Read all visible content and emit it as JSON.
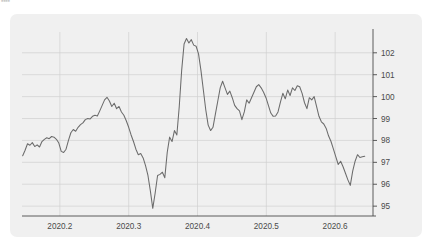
{
  "corner_artifact": "▪▪▪▪",
  "card": {
    "background_color": "#f0f0f0",
    "page_background_color": "#ffffff"
  },
  "chart_data": {
    "type": "line",
    "title": "",
    "subtitle": "",
    "xlabel": "",
    "ylabel": "",
    "grid": true,
    "legend": false,
    "legend_position": "none",
    "y_axis_side": "right",
    "line_color": "#6b6b6b",
    "grid_color": "#d0d0d0",
    "axis_color": "#4a4a4a",
    "xlim": [
      2020.145,
      2020.655
    ],
    "ylim": [
      94.55,
      102.95
    ],
    "xticks": [
      2020.2,
      2020.3,
      2020.4,
      2020.5,
      2020.6
    ],
    "xticklabels": [
      "2020.2",
      "2020.3",
      "2020.4",
      "2020.5",
      "2020.6"
    ],
    "yticks": [
      95,
      96,
      97,
      98,
      99,
      100,
      101,
      102
    ],
    "yticklabels": [
      "95",
      "96",
      "97",
      "98",
      "99",
      "100",
      "101",
      "102"
    ],
    "x": [
      2020.146,
      2020.1495,
      2020.153,
      2020.1565,
      2020.16,
      2020.1635,
      2020.167,
      2020.1705,
      2020.174,
      2020.1775,
      2020.181,
      2020.1845,
      2020.188,
      2020.1915,
      2020.195,
      2020.1985,
      2020.202,
      2020.2055,
      2020.209,
      2020.2125,
      2020.216,
      2020.2195,
      2020.223,
      2020.2265,
      2020.23,
      2020.2335,
      2020.237,
      2020.2405,
      2020.244,
      2020.2475,
      2020.251,
      2020.2545,
      2020.258,
      2020.2615,
      2020.265,
      2020.2685,
      2020.272,
      2020.2755,
      2020.279,
      2020.2825,
      2020.286,
      2020.2895,
      2020.293,
      2020.2965,
      2020.3,
      2020.3035,
      2020.307,
      2020.3105,
      2020.314,
      2020.3175,
      2020.321,
      2020.3245,
      2020.328,
      2020.3315,
      2020.335,
      2020.3385,
      2020.342,
      2020.3455,
      2020.349,
      2020.3525,
      2020.356,
      2020.3595,
      2020.363,
      2020.3665,
      2020.37,
      2020.3735,
      2020.377,
      2020.3805,
      2020.384,
      2020.3875,
      2020.391,
      2020.3945,
      2020.398,
      2020.4015,
      2020.405,
      2020.4085,
      2020.412,
      2020.4155,
      2020.419,
      2020.4225,
      2020.426,
      2020.4295,
      2020.433,
      2020.4365,
      2020.44,
      2020.4435,
      2020.447,
      2020.4505,
      2020.454,
      2020.4575,
      2020.461,
      2020.4645,
      2020.468,
      2020.4715,
      2020.475,
      2020.4785,
      2020.482,
      2020.4855,
      2020.489,
      2020.4925,
      2020.496,
      2020.4995,
      2020.503,
      2020.5065,
      2020.51,
      2020.5135,
      2020.517,
      2020.5205,
      2020.524,
      2020.5275,
      2020.531,
      2020.5345,
      2020.538,
      2020.5415,
      2020.545,
      2020.5485,
      2020.552,
      2020.5555,
      2020.559,
      2020.5625,
      2020.566,
      2020.5695,
      2020.573,
      2020.5765,
      2020.58,
      2020.5835,
      2020.587,
      2020.5905,
      2020.594,
      2020.5975,
      2020.601,
      2020.6045,
      2020.608,
      2020.6115,
      2020.615,
      2020.6185,
      2020.622,
      2020.6255,
      2020.629,
      2020.6325,
      2020.636,
      2020.6395,
      2020.643,
      2020.6465,
      2020.65
    ],
    "y": [
      97.3,
      97.55,
      97.85,
      97.78,
      97.9,
      97.72,
      97.8,
      97.7,
      97.95,
      98.05,
      98.12,
      98.08,
      98.18,
      98.15,
      98.05,
      97.88,
      97.5,
      97.45,
      97.6,
      98.0,
      98.35,
      98.5,
      98.42,
      98.6,
      98.72,
      98.8,
      98.95,
      99.0,
      98.98,
      99.1,
      99.15,
      99.12,
      99.35,
      99.6,
      99.85,
      99.97,
      99.8,
      99.55,
      99.7,
      99.45,
      99.55,
      99.3,
      99.15,
      98.9,
      98.6,
      98.25,
      97.95,
      97.6,
      97.35,
      97.4,
      97.2,
      96.85,
      96.4,
      95.7,
      94.9,
      95.6,
      96.4,
      96.45,
      96.55,
      96.3,
      97.45,
      98.15,
      97.95,
      98.45,
      98.25,
      99.55,
      101.2,
      102.4,
      102.65,
      102.45,
      102.6,
      102.35,
      102.3,
      101.95,
      101.2,
      100.3,
      99.4,
      98.7,
      98.45,
      98.6,
      99.2,
      99.8,
      100.4,
      100.7,
      100.4,
      100.1,
      100.25,
      99.95,
      99.6,
      99.45,
      99.35,
      98.95,
      99.3,
      99.85,
      99.7,
      99.95,
      100.2,
      100.45,
      100.55,
      100.4,
      100.2,
      99.95,
      99.6,
      99.25,
      99.1,
      99.12,
      99.3,
      99.75,
      100.15,
      99.9,
      100.3,
      100.05,
      100.4,
      100.28,
      100.5,
      100.45,
      100.15,
      99.72,
      99.45,
      99.95,
      99.85,
      100.0,
      99.55,
      99.1,
      98.85,
      98.75,
      98.55,
      98.2,
      97.95,
      97.6,
      97.25,
      96.9,
      97.05,
      96.8,
      96.5,
      96.2,
      95.95,
      96.6,
      97.05,
      97.35,
      97.22,
      97.25,
      97.28
    ],
    "series": [
      {
        "name": "index",
        "color": "#6b6b6b",
        "min": 94.9,
        "max": 102.65,
        "start": 97.3,
        "end": 97.28
      }
    ]
  }
}
